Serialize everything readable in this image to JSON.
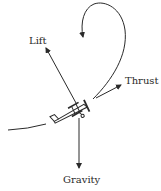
{
  "diagram": {
    "colors": {
      "stroke": "#2a2a2a",
      "background": "#ffffff"
    },
    "labels": {
      "lift": "Lift",
      "thrust": "Thrust",
      "gravity": "Gravity"
    },
    "elements": [
      {
        "id": "loop-path",
        "type": "curved-arrow",
        "description": "flight path loop"
      },
      {
        "id": "lift-arrow",
        "type": "force-arrow",
        "label": "Lift"
      },
      {
        "id": "thrust-arrow",
        "type": "force-arrow",
        "label": "Thrust"
      },
      {
        "id": "gravity-arrow",
        "type": "force-arrow",
        "label": "Gravity"
      },
      {
        "id": "airplane",
        "type": "icon",
        "description": "biplane"
      }
    ]
  }
}
